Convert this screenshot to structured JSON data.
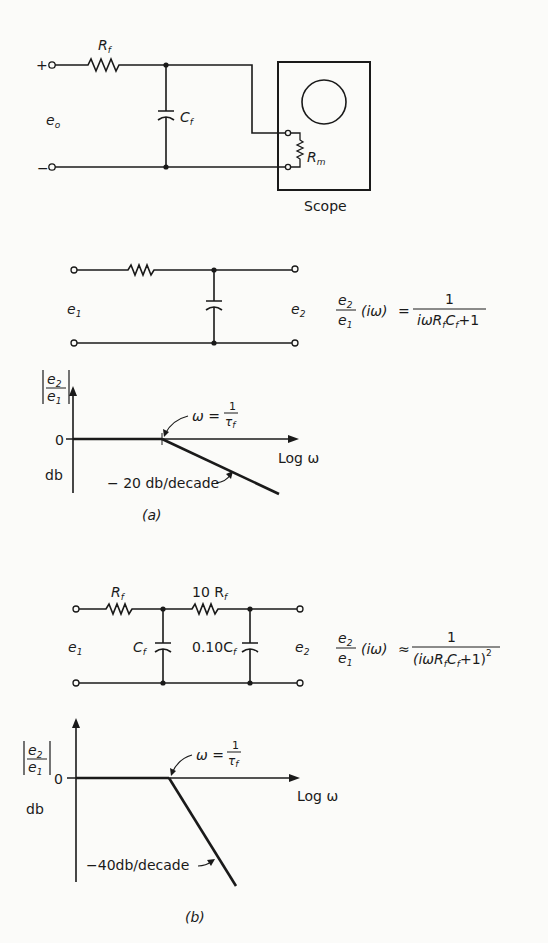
{
  "figure": {
    "top_circuit": {
      "input_plus": "+",
      "input_minus": "−",
      "input_label": "e",
      "input_label_sub": "o",
      "resistor_label": "R",
      "resistor_sub": "f",
      "capacitor_label": "C",
      "capacitor_sub": "f",
      "meter_resistor_label": "R",
      "meter_resistor_sub": "m",
      "scope_label": "Scope"
    },
    "part_a": {
      "input_label": "e",
      "input_sub": "1",
      "output_label": "e",
      "output_sub": "2",
      "tf_lhs_num": "e",
      "tf_lhs_num_sub": "2",
      "tf_lhs_den": "e",
      "tf_lhs_den_sub": "1",
      "tf_arg": "(iω)",
      "tf_relation": "=",
      "tf_rhs_num": "1",
      "tf_rhs_den": "iωR",
      "tf_rhs_den_r_sub": "f",
      "tf_rhs_den_c": "C",
      "tf_rhs_den_c_sub": "f",
      "tf_rhs_den_tail": "+1",
      "bode": {
        "y_label_num": "e",
        "y_label_num_sub": "2",
        "y_label_den": "e",
        "y_label_den_sub": "1",
        "y_unit": "db",
        "zero_tick": "0",
        "x_label": "Log ω",
        "break_label": "ω =",
        "break_num": "1",
        "break_den": "τ",
        "break_den_sub": "f",
        "slope_label": "− 20 db/decade"
      },
      "caption": "(a)"
    },
    "part_b": {
      "input_label": "e",
      "input_sub": "1",
      "output_label": "e",
      "output_sub": "2",
      "r1_label": "R",
      "r1_sub": "f",
      "r2_label": "10 R",
      "r2_sub": "f",
      "c1_label": "C",
      "c1_sub": "f",
      "c2_label": "0.10C",
      "c2_sub": "f",
      "tf_lhs_num": "e",
      "tf_lhs_num_sub": "2",
      "tf_lhs_den": "e",
      "tf_lhs_den_sub": "1",
      "tf_arg": "(iω)",
      "tf_relation": "≈",
      "tf_rhs_num": "1",
      "tf_rhs_den": "(iωR",
      "tf_rhs_den_r_sub": "f",
      "tf_rhs_den_c": "C",
      "tf_rhs_den_c_sub": "f",
      "tf_rhs_den_tail": "+1)",
      "tf_rhs_den_exp": "2",
      "bode": {
        "y_label_num": "e",
        "y_label_num_sub": "2",
        "y_label_den": "e",
        "y_label_den_sub": "1",
        "y_unit": "db",
        "zero_tick": "0",
        "x_label": "Log ω",
        "break_label": "ω =",
        "break_num": "1",
        "break_den": "τ",
        "break_den_sub": "f",
        "slope_label": "−40db/decade"
      },
      "caption": "(b)"
    }
  }
}
